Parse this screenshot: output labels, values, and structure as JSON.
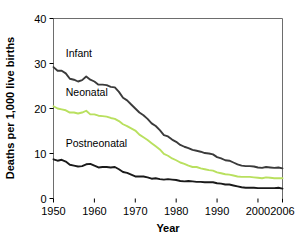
{
  "chart_data": {
    "type": "line",
    "title": "",
    "xlabel": "Year",
    "ylabel": "Deaths per 1,000 live births",
    "xlim": [
      1950,
      2006
    ],
    "ylim": [
      0,
      40
    ],
    "grid": false,
    "legend_position": "inline-annotations",
    "xticks": [
      1950,
      1960,
      1970,
      1980,
      1990,
      2000,
      2006
    ],
    "xtick_labels": [
      "1950",
      "1960",
      "1970",
      "1980",
      "1990",
      "2000",
      "2006"
    ],
    "yticks": [
      0,
      10,
      20,
      30,
      40
    ],
    "ytick_labels": [
      "0",
      "10",
      "20",
      "30",
      "40"
    ],
    "x": [
      1950,
      1951,
      1952,
      1953,
      1954,
      1955,
      1956,
      1957,
      1958,
      1959,
      1960,
      1961,
      1962,
      1963,
      1964,
      1965,
      1966,
      1967,
      1968,
      1969,
      1970,
      1971,
      1972,
      1973,
      1974,
      1975,
      1976,
      1977,
      1978,
      1979,
      1980,
      1981,
      1982,
      1983,
      1984,
      1985,
      1986,
      1987,
      1988,
      1989,
      1990,
      1991,
      1992,
      1993,
      1994,
      1995,
      1996,
      1997,
      1998,
      1999,
      2000,
      2001,
      2002,
      2003,
      2004,
      2005,
      2006
    ],
    "series": [
      {
        "name": "Infant",
        "color": "#3b3b3b",
        "label_x": 1953,
        "label_y": 31.5,
        "values": [
          29.2,
          28.4,
          28.4,
          27.8,
          26.6,
          26.4,
          26.0,
          26.3,
          27.1,
          26.4,
          26.0,
          25.3,
          25.3,
          25.2,
          24.8,
          24.7,
          23.7,
          22.4,
          21.8,
          20.9,
          20.0,
          19.1,
          18.5,
          17.7,
          16.7,
          16.1,
          15.2,
          14.1,
          13.8,
          13.1,
          12.6,
          11.9,
          11.5,
          11.2,
          10.8,
          10.6,
          10.4,
          10.1,
          10.0,
          9.8,
          9.2,
          8.9,
          8.5,
          8.4,
          8.0,
          7.6,
          7.3,
          7.2,
          7.2,
          7.1,
          6.9,
          6.8,
          7.0,
          6.9,
          6.8,
          6.9,
          6.7
        ]
      },
      {
        "name": "Neonatal",
        "color": "#b9e05f",
        "label_x": 1953,
        "label_y": 22.8,
        "values": [
          20.5,
          20.0,
          19.8,
          19.6,
          19.1,
          19.1,
          18.9,
          19.1,
          19.5,
          18.7,
          18.7,
          18.4,
          18.3,
          18.2,
          17.9,
          17.7,
          17.2,
          16.5,
          16.1,
          15.6,
          15.1,
          14.2,
          13.6,
          13.0,
          12.3,
          11.6,
          10.9,
          9.9,
          9.5,
          8.9,
          8.5,
          8.0,
          7.7,
          7.3,
          7.0,
          7.0,
          6.7,
          6.5,
          6.3,
          6.2,
          5.8,
          5.6,
          5.4,
          5.3,
          5.1,
          4.9,
          4.8,
          4.8,
          4.8,
          4.7,
          4.6,
          4.5,
          4.7,
          4.6,
          4.5,
          4.5,
          4.5
        ]
      },
      {
        "name": "Postneonatal",
        "color": "#1a1a1a",
        "label_x": 1953,
        "label_y": 11.4,
        "values": [
          8.7,
          8.4,
          8.6,
          8.2,
          7.5,
          7.3,
          7.1,
          7.2,
          7.6,
          7.7,
          7.3,
          6.9,
          7.0,
          7.0,
          6.9,
          7.0,
          6.5,
          5.9,
          5.7,
          5.3,
          4.9,
          4.9,
          4.9,
          4.7,
          4.4,
          4.5,
          4.3,
          4.2,
          4.3,
          4.2,
          4.1,
          3.9,
          3.8,
          3.9,
          3.8,
          3.7,
          3.7,
          3.6,
          3.6,
          3.6,
          3.4,
          3.3,
          3.1,
          3.1,
          2.9,
          2.7,
          2.5,
          2.4,
          2.4,
          2.4,
          2.3,
          2.3,
          2.3,
          2.3,
          2.3,
          2.4,
          2.2
        ]
      }
    ]
  }
}
